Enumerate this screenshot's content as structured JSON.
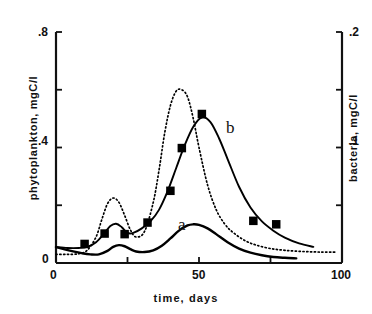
{
  "chart_data": {
    "type": "line",
    "title": "",
    "xlabel": "time, days",
    "ylabel": "phytoplankton, mgC/l",
    "ylabel_right": "bacteria, mgC/l",
    "xlim": [
      0,
      100
    ],
    "ylim": [
      0,
      0.8
    ],
    "ylim_right": [
      0,
      0.2
    ],
    "grid": false,
    "legend": "inline-curve-labels",
    "xticks": [
      0,
      50,
      100
    ],
    "xtick_labels": [
      "0",
      "50",
      "100"
    ],
    "xminor_ticks": [
      25,
      75
    ],
    "yticks_left": [
      0,
      0.4,
      0.8
    ],
    "ytick_labels_left": [
      "0",
      ".4",
      ".8"
    ],
    "yminor_ticks_left": [
      0.2,
      0.6
    ],
    "yticks_right": [
      0.1,
      0.2
    ],
    "ytick_labels_right": [
      ".1",
      ".2"
    ],
    "yminor_ticks_right": [
      0.05,
      0.15
    ],
    "series": [
      {
        "name": "a",
        "label": "a",
        "axis": "left",
        "style": "solid",
        "color": "#000000",
        "description": "phytoplankton model curve",
        "x": [
          0,
          3,
          6,
          9,
          12,
          15,
          18,
          20,
          22,
          24,
          26,
          28,
          31,
          34,
          37,
          40,
          43,
          46,
          48,
          50,
          53,
          56,
          60,
          64,
          68,
          72,
          76,
          80,
          84
        ],
        "y": [
          0.055,
          0.047,
          0.04,
          0.034,
          0.03,
          0.03,
          0.042,
          0.056,
          0.062,
          0.058,
          0.048,
          0.04,
          0.038,
          0.044,
          0.06,
          0.085,
          0.112,
          0.13,
          0.134,
          0.132,
          0.12,
          0.1,
          0.072,
          0.05,
          0.036,
          0.027,
          0.021,
          0.018,
          0.016
        ]
      },
      {
        "name": "b",
        "label": "b",
        "axis": "right",
        "style": "solid-with-markers",
        "color": "#000000",
        "marker": "filled-square",
        "description": "bacteria model curve",
        "x": [
          0,
          4,
          8,
          11,
          14,
          17,
          19,
          21,
          23,
          25,
          27,
          30,
          33,
          36,
          39,
          42,
          45,
          48,
          51,
          54,
          57,
          60,
          64,
          68,
          72,
          76,
          80,
          85,
          90
        ],
        "y": [
          0.014,
          0.013,
          0.013,
          0.014,
          0.018,
          0.026,
          0.032,
          0.034,
          0.031,
          0.026,
          0.026,
          0.03,
          0.036,
          0.046,
          0.062,
          0.082,
          0.102,
          0.118,
          0.126,
          0.122,
          0.108,
          0.09,
          0.066,
          0.048,
          0.036,
          0.028,
          0.022,
          0.017,
          0.014
        ]
      },
      {
        "name": "dotted",
        "label": "",
        "axis": "left",
        "style": "dotted",
        "color": "#000000",
        "description": "dotted reference curve, double-peaked",
        "x": [
          0,
          4,
          8,
          11,
          14,
          16,
          18,
          20,
          22,
          24,
          26,
          28,
          31,
          34,
          36,
          38,
          40,
          42,
          44,
          46,
          48,
          50,
          53,
          56,
          59,
          62,
          66,
          70,
          75,
          80,
          86,
          92,
          98
        ],
        "y": [
          0.03,
          0.03,
          0.032,
          0.045,
          0.09,
          0.15,
          0.205,
          0.225,
          0.21,
          0.165,
          0.115,
          0.09,
          0.11,
          0.21,
          0.32,
          0.45,
          0.545,
          0.595,
          0.6,
          0.575,
          0.5,
          0.4,
          0.27,
          0.185,
          0.135,
          0.105,
          0.078,
          0.062,
          0.05,
          0.044,
          0.04,
          0.038,
          0.038
        ]
      }
    ],
    "markers": {
      "series": "b",
      "label": "bacteria measured data points",
      "points": [
        {
          "x": 10,
          "y": 0.0165
        },
        {
          "x": 17,
          "y": 0.0255
        },
        {
          "x": 24,
          "y": 0.025
        },
        {
          "x": 32,
          "y": 0.035
        },
        {
          "x": 40,
          "y": 0.0625
        },
        {
          "x": 44,
          "y": 0.0995
        },
        {
          "x": 51,
          "y": 0.129
        },
        {
          "x": 69,
          "y": 0.0365
        },
        {
          "x": 77,
          "y": 0.0335
        }
      ]
    }
  },
  "labels": {
    "curve_a": "a",
    "curve_b": "b",
    "x_axis_title": "time, days",
    "y_axis_title_left": "phytoplankton, mgC/l",
    "y_axis_title_right": "bacteria, mgC/l",
    "xtick_0": "0",
    "xtick_50": "50",
    "xtick_100": "100",
    "ytick_left_0": "0",
    "ytick_left_4": ".4",
    "ytick_left_8": ".8",
    "ytick_right_1": ".1",
    "ytick_right_2": ".2"
  },
  "colors": {
    "axis": "#111111",
    "curve": "#000000",
    "marker": "#000000",
    "background": "#ffffff"
  }
}
